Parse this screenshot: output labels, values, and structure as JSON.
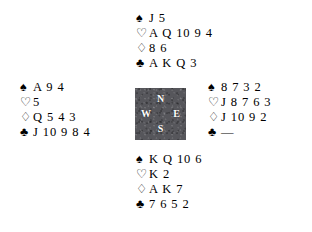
{
  "diagram": {
    "type": "bridge-hand-deal",
    "suit_symbols": {
      "spades": "♠",
      "hearts": "♡",
      "diamonds": "♢",
      "clubs": "♣"
    },
    "compass": {
      "north": "N",
      "west": "W",
      "east": "E",
      "south": "S",
      "background_color": "#56565b",
      "text_color": "#ffffff"
    },
    "hands": {
      "north": {
        "label": "North",
        "spades": "J 5",
        "hearts": "A Q 10 9 4",
        "diamonds": "8 6",
        "clubs": "A K Q 3"
      },
      "west": {
        "label": "West",
        "spades": "A 9 4",
        "hearts": "5",
        "diamonds": "Q 5 4 3",
        "clubs": "J 10 9 8 4"
      },
      "east": {
        "label": "East",
        "spades": "8 7 3 2",
        "hearts": "J 8 7 6 3",
        "diamonds": "J 10 9 2",
        "clubs": "—"
      },
      "south": {
        "label": "South",
        "spades": "K Q 10 6",
        "hearts": "K 2",
        "diamonds": "A K 7",
        "clubs": "7 6 5 2"
      }
    }
  }
}
